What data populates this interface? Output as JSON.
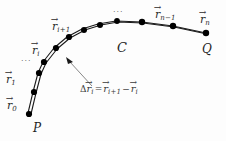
{
  "figure": {
    "background_color": "#fdfdfd",
    "stroke_color": "#1a1a1a",
    "node_color": "#000000",
    "label_color": "#2b2b2b"
  },
  "curve": {
    "name": "C",
    "label": "C",
    "start_point_label": "P",
    "end_point_label": "Q",
    "inner_path": "M 28 113 L 33 92 L 38 73 L 43 62 L 54 48 L 67 37 L 82 29 L 98 24 L 116 21 L 142 22 L 173 26 L 206 33",
    "outer_path": "M 31 114 L 36 93 L 41 74 L 46 63 L 57 49 L 70 38 L 85 30 L 101 25 L 118 22 L 143 23 L 174 27 L 207 34"
  },
  "vertices": [
    {
      "id": "r0",
      "x": 29,
      "y": 114
    },
    {
      "id": "r1",
      "x": 34,
      "y": 92
    },
    {
      "id": "r_a",
      "x": 39,
      "y": 73
    },
    {
      "id": "ri",
      "x": 44,
      "y": 62
    },
    {
      "id": "r_b",
      "x": 56,
      "y": 48
    },
    {
      "id": "ri1",
      "x": 69,
      "y": 37
    },
    {
      "id": "r_c",
      "x": 84,
      "y": 30
    },
    {
      "id": "r_d",
      "x": 100,
      "y": 25
    },
    {
      "id": "r_e",
      "x": 117,
      "y": 21
    },
    {
      "id": "r_f",
      "x": 142,
      "y": 22
    },
    {
      "id": "rn1",
      "x": 173,
      "y": 26
    },
    {
      "id": "rn",
      "x": 206,
      "y": 33
    }
  ],
  "labels": {
    "r0": {
      "symbol": "r",
      "sub": "0"
    },
    "r1": {
      "symbol": "r",
      "sub": "1"
    },
    "ri": {
      "symbol": "r",
      "sub": "i"
    },
    "ri1": {
      "symbol": "r",
      "sub": "i+1"
    },
    "rn1": {
      "symbol": "r",
      "sub": "n−1"
    },
    "rn": {
      "symbol": "r",
      "sub": "n"
    },
    "curve_label": "C",
    "point_p": "P",
    "point_q": "Q",
    "ellipsis_left": "···",
    "ellipsis_top": "···"
  },
  "annotation": {
    "delta": "Δ",
    "lhs_symbol": "r",
    "lhs_sub": "i",
    "equals": "=",
    "term1_symbol": "r",
    "term1_sub": "i+1",
    "minus": "−",
    "term2_symbol": "r",
    "term2_sub": "i",
    "arrow_color": "#6a6a6a",
    "leader_path": "M 92 86 L 68 60"
  }
}
